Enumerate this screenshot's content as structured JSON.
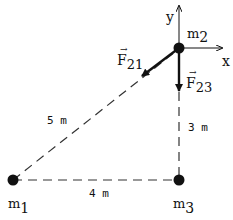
{
  "diagram": {
    "masses": {
      "m1": {
        "label": "m",
        "sub": "1"
      },
      "m2": {
        "label": "m",
        "sub": "2"
      },
      "m3": {
        "label": "m",
        "sub": "3"
      }
    },
    "axes": {
      "x": "x",
      "y": "y"
    },
    "forces": {
      "f21": {
        "label": "F",
        "sub": "21",
        "arrow": "→"
      },
      "f23": {
        "label": "F",
        "sub": "23",
        "arrow": "→"
      }
    },
    "distances": {
      "hyp": "5 m",
      "vertical": "3 m",
      "horizontal": "4 m"
    },
    "color": "#111111"
  }
}
